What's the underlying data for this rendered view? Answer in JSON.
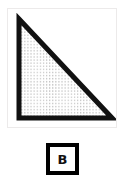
{
  "figure": {
    "name": "right-triangle-figure",
    "shape_type": "right triangle",
    "fill_pattern": "fine gray dot stipple",
    "outline_color": "#111111",
    "fill_color": "#ffffff",
    "pattern_color": "#b8b8b8",
    "card_background": "#ffffff",
    "card_border_color": "#eceaea",
    "outline_width_px": 5,
    "vertices": [
      {
        "name": "apex-top-left",
        "x": 11,
        "y": 10
      },
      {
        "name": "right-angle-bottom-right",
        "x": 104,
        "y": 109
      },
      {
        "name": "bottom-left",
        "x": 11,
        "y": 109
      }
    ]
  },
  "label": {
    "text": "B",
    "border_color": "#000000",
    "background_color": "#ffffff",
    "text_color": "#111111"
  }
}
